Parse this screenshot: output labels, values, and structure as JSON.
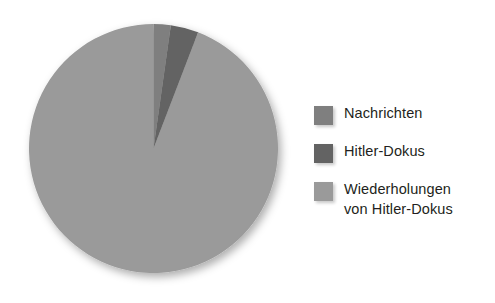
{
  "chart_data": {
    "type": "pie",
    "title": "",
    "subtitle": "",
    "xlabel": "",
    "ylabel": "",
    "grid": false,
    "legend_position": "right",
    "start_angle_deg": 0,
    "direction": "clockwise",
    "categories": [
      "Nachrichten",
      "Hitler-Dokus",
      "Wiederholungen von Hitler-Dokus"
    ],
    "values": [
      2.2,
      3.6,
      94.2
    ],
    "slices": [
      {
        "label": "Nachrichten",
        "value": 2.2,
        "color": "#7f7f7f",
        "start_angle_deg": 0,
        "end_angle_deg": 8
      },
      {
        "label": "Hitler-Dokus",
        "value": 3.6,
        "color": "#636363",
        "start_angle_deg": 8,
        "end_angle_deg": 21
      },
      {
        "label": "Wiederholungen von Hitler-Dokus",
        "value": 94.2,
        "color": "#9a9a9a",
        "start_angle_deg": 21,
        "end_angle_deg": 360
      }
    ],
    "geometry": {
      "center_x": 124.5,
      "center_y": 124.5,
      "radius": 124.5
    }
  },
  "legend": {
    "items": [
      {
        "label": "Nachrichten",
        "color": "#7f7f7f",
        "swatch_name": "legend-swatch-nachrichten"
      },
      {
        "label": "Hitler-Dokus",
        "color": "#636363",
        "swatch_name": "legend-swatch-hitler-dokus"
      },
      {
        "label": "Wiederholungen\nvon Hitler-Dokus",
        "color": "#9a9a9a",
        "swatch_name": "legend-swatch-wiederholungen"
      }
    ]
  },
  "colors": {
    "background": "#ffffff",
    "text": "#231f20",
    "slice_light": "#9a9a9a",
    "slice_medium": "#7f7f7f",
    "slice_dark": "#636363"
  }
}
